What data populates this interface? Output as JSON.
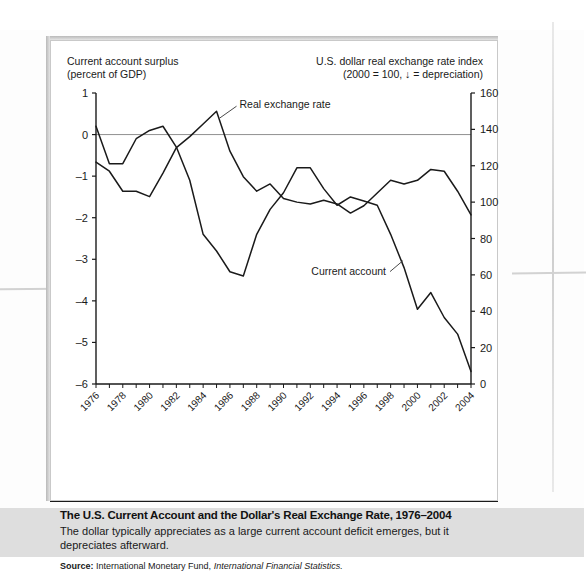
{
  "figure": {
    "left_axis_header": "Current account surplus\n(percent of GDP)",
    "left_axis_header_line1": "Current account surplus",
    "left_axis_header_line2": "(percent of GDP)",
    "right_axis_header_line1": "U.S. dollar real exchange rate index",
    "right_axis_header_line2": "(2000  = 100, ↓ = depreciation)",
    "caption_title": "The U.S. Current Account and the Dollar's Real Exchange Rate, 1976–2004",
    "caption_text": "The dollar typically appreciates as a large current account deficit emerges, but it depreciates afterward.",
    "source_label": "Source:",
    "source_text": "International Monetary Fund,",
    "source_publication": "International Financial Statistics."
  },
  "chart_data": {
    "type": "line",
    "title": "The U.S. Current Account and the Dollar's Real Exchange Rate, 1976–2004",
    "xlabel": "",
    "ylabel": "Current account surplus (percent of GDP)",
    "y2label": "U.S. dollar real exchange rate index (2000 = 100)",
    "grid": false,
    "legend": "inline-annotations",
    "x": [
      1976,
      1977,
      1978,
      1979,
      1980,
      1981,
      1982,
      1983,
      1984,
      1985,
      1986,
      1987,
      1988,
      1989,
      1990,
      1991,
      1992,
      1993,
      1994,
      1995,
      1996,
      1997,
      1998,
      1999,
      2000,
      2001,
      2002,
      2003,
      2004
    ],
    "xtick_labels": [
      "1976",
      "1978",
      "1980",
      "1982",
      "1984",
      "1986",
      "1988",
      "1990",
      "1992",
      "1994",
      "1996",
      "1998",
      "2000",
      "2002",
      "2004"
    ],
    "xtick_values": [
      1976,
      1978,
      1980,
      1982,
      1984,
      1986,
      1988,
      1990,
      1992,
      1994,
      1996,
      1998,
      2000,
      2002,
      2004
    ],
    "xlim": [
      1976,
      2004
    ],
    "ylim": [
      -6,
      1
    ],
    "ytick_labels": [
      "1",
      "0",
      "–1",
      "–2",
      "–3",
      "–4",
      "–5",
      "–6"
    ],
    "ytick_values": [
      1,
      0,
      -1,
      -2,
      -3,
      -4,
      -5,
      -6
    ],
    "y2lim": [
      0,
      160
    ],
    "y2tick_labels": [
      "160",
      "140",
      "120",
      "100",
      "80",
      "60",
      "40",
      "20",
      "0"
    ],
    "y2tick_values": [
      160,
      140,
      120,
      100,
      80,
      60,
      40,
      20,
      0
    ],
    "series": [
      {
        "name": "Current account",
        "axis": "left",
        "annotation": "Current account",
        "values": [
          0.2,
          -0.7,
          -0.7,
          -0.1,
          0.1,
          0.2,
          -0.3,
          -1.1,
          -2.4,
          -2.8,
          -3.3,
          -3.4,
          -2.4,
          -1.8,
          -1.4,
          -0.8,
          -0.8,
          -1.3,
          -1.7,
          -1.5,
          -1.6,
          -1.7,
          -2.4,
          -3.2,
          -4.2,
          -3.8,
          -4.4,
          -4.8,
          -5.7
        ]
      },
      {
        "name": "Real exchange rate",
        "axis": "right",
        "annotation": "Real exchange rate",
        "values": [
          122,
          117,
          106,
          106,
          103,
          116,
          130,
          136,
          143,
          150,
          128,
          114,
          106,
          110,
          102,
          100,
          99,
          101,
          99,
          94,
          98,
          105,
          112,
          110,
          112,
          118,
          117,
          106,
          93
        ]
      }
    ],
    "annotations": [
      {
        "text": "Real exchange rate",
        "series": "Real exchange rate",
        "points_to_year": 1985
      },
      {
        "text": "Current account",
        "series": "Current account",
        "points_to_year": 1999
      }
    ]
  }
}
